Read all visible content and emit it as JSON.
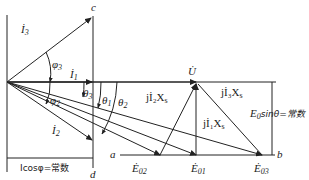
{
  "diagram": {
    "type": "phasor-diagram",
    "colors": {
      "line": "#222222",
      "background": "#ffffff"
    },
    "labels": {
      "I3": "İ",
      "I3_sub": "3",
      "I1": "İ",
      "I1_sub": "1",
      "I2": "İ",
      "I2_sub": "2",
      "phi3": "φ",
      "phi3_sub": "3",
      "phi2": "φ",
      "phi2_sub": "2",
      "theta3": "θ",
      "theta3_sub": "3",
      "theta1": "θ",
      "theta1_sub": "1",
      "theta2": "θ",
      "theta2_sub": "2",
      "U": "U̇",
      "c": "c",
      "d": "d",
      "a": "a",
      "b": "b",
      "E02": "Ė",
      "E02_sub": "02",
      "E01": "Ė",
      "E01_sub": "01",
      "E03": "Ė",
      "E03_sub": "03",
      "jI2Xs": "jİ₂X",
      "jI2Xs_sub": "s",
      "jI3Xs": "jİ₃X",
      "jI3Xs_sub": "s",
      "jI1Xs": "jİ₁X",
      "jI1Xs_sub": "s",
      "E0sin": "E",
      "E0sin_sub": "0",
      "E0sin_rest": "sinθ=常数",
      "Icos": "Icosφ=常数"
    }
  }
}
